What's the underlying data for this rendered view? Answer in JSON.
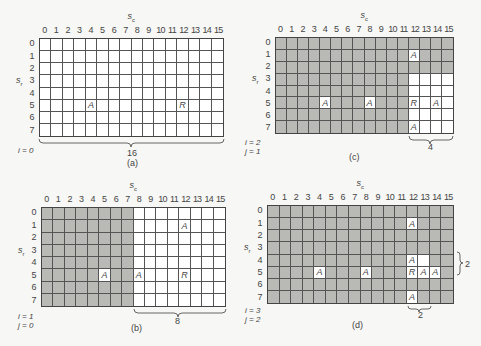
{
  "axis_labels": {
    "col": "s",
    "col_sub": "c",
    "row": "s",
    "row_sub": "r"
  },
  "col_labels": [
    "0",
    "1",
    "2",
    "3",
    "4",
    "5",
    "6",
    "7",
    "8",
    "9",
    "10",
    "11",
    "12",
    "13",
    "14",
    "15"
  ],
  "row_labels": [
    "0",
    "1",
    "2",
    "3",
    "4",
    "5",
    "6",
    "7"
  ],
  "colors": {
    "shaded": "#b9b9b6",
    "unshaded": "#ffffff",
    "line": "#555555"
  },
  "panels": [
    {
      "id": "a",
      "caption": "(a)",
      "index_lines": [
        "i = 0"
      ],
      "grid": {
        "x": 39,
        "y": 38,
        "w": 185,
        "h": 99
      },
      "shaded_cells": "none",
      "white_cells": "all",
      "marks": [
        {
          "row": 5,
          "col": 4,
          "label": "A"
        },
        {
          "row": 5,
          "col": 12,
          "label": "R"
        }
      ],
      "braces": [
        {
          "orientation": "horizontal",
          "label": "8",
          "span": "cols 4-12, row 6"
        },
        {
          "orientation": "horizontal",
          "label": "16",
          "span": "cols 0-15, below grid"
        }
      ]
    },
    {
      "id": "b",
      "caption": "(b)",
      "index_lines": [
        "i = 1",
        "j = 0"
      ],
      "grid": {
        "x": 41,
        "y": 207,
        "w": 185,
        "h": 100
      },
      "shaded_region": "cols 0-7, all rows",
      "marks": [
        {
          "row": 5,
          "col": 5,
          "label": "A"
        },
        {
          "row": 5,
          "col": 8,
          "label": "A"
        },
        {
          "row": 1,
          "col": 12,
          "label": "A"
        },
        {
          "row": 5,
          "col": 12,
          "label": "R"
        }
      ],
      "braces": [
        {
          "orientation": "horizontal",
          "label": "4",
          "span": "cols 8-12, row 6"
        },
        {
          "orientation": "vertical",
          "label": "4",
          "span": "rows 1-5, col 13"
        },
        {
          "orientation": "horizontal",
          "label": "8",
          "span": "cols 8-15, below grid"
        }
      ]
    },
    {
      "id": "c",
      "caption": "(c)",
      "index_lines": [
        "i = 2",
        "j = 1"
      ],
      "grid": {
        "x": 275,
        "y": 37,
        "w": 179,
        "h": 97
      },
      "shaded_region": "all except cols 12-15 rows 3-7 and marked cells",
      "marks": [
        {
          "row": 1,
          "col": 12,
          "label": "A"
        },
        {
          "row": 5,
          "col": 4,
          "label": "A"
        },
        {
          "row": 5,
          "col": 8,
          "label": "A"
        },
        {
          "row": 5,
          "col": 12,
          "label": "R"
        },
        {
          "row": 5,
          "col": 14,
          "label": "A"
        },
        {
          "row": 7,
          "col": 12,
          "label": "A"
        }
      ],
      "braces": [
        {
          "orientation": "horizontal",
          "label": "2",
          "span": "cols 12-14, row 4"
        },
        {
          "orientation": "vertical",
          "label": "2",
          "span": "rows 5-7, col 13"
        },
        {
          "orientation": "horizontal",
          "label": "4",
          "span": "cols 12-15, below grid"
        }
      ]
    },
    {
      "id": "d",
      "caption": "(d)",
      "index_lines": [
        "i = 3",
        "j = 2"
      ],
      "grid": {
        "x": 267,
        "y": 205,
        "w": 187,
        "h": 99
      },
      "shaded_region": "all except marked cells and (4,13)",
      "marks": [
        {
          "row": 1,
          "col": 12,
          "label": "A"
        },
        {
          "row": 4,
          "col": 12,
          "label": "A"
        },
        {
          "row": 5,
          "col": 4,
          "label": "A"
        },
        {
          "row": 5,
          "col": 8,
          "label": "A"
        },
        {
          "row": 5,
          "col": 12,
          "label": "R"
        },
        {
          "row": 5,
          "col": 13,
          "label": "A"
        },
        {
          "row": 5,
          "col": 14,
          "label": "A"
        },
        {
          "row": 7,
          "col": 12,
          "label": "A"
        }
      ],
      "extra_white": [
        {
          "row": 4,
          "col": 13
        }
      ],
      "braces": [
        {
          "orientation": "vertical",
          "label": "2",
          "span": "rows 4-5, right of grid"
        },
        {
          "orientation": "horizontal",
          "label": "2",
          "span": "cols 12-13, below grid"
        }
      ]
    }
  ]
}
